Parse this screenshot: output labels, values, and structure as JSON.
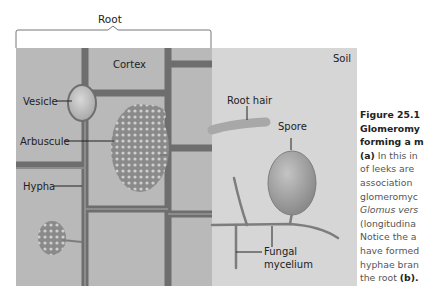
{
  "diagram": {
    "root_label": "Root",
    "soil_label": "Soil",
    "labels": {
      "cortex": "Cortex",
      "vesicle": "Vesicle",
      "arbuscule": "Arbuscule",
      "hypha": "Hypha",
      "root_hair": "Root hair",
      "spore": "Spore",
      "fungal_mycelium_line1": "Fungal",
      "fungal_mycelium_line2": "mycelium"
    },
    "colors": {
      "root_cell": "#b9b9b9",
      "cell_wall": "#6e6e6e",
      "soil": "#d6d6d6",
      "spore": "#9a9a9a",
      "hyphae": "#7d7d7d"
    }
  },
  "caption": {
    "figure_number": "Figure 25.1",
    "lines": [
      "Glomeromy",
      "forming a m",
      "In this in",
      "of leeks are",
      "association",
      "glomeromyc",
      "Glomus vers",
      "(longitudina",
      "Notice the a",
      "have formed",
      "hyphae bran",
      "the root"
    ],
    "marker_a": "(a)",
    "marker_b": "(b)."
  }
}
